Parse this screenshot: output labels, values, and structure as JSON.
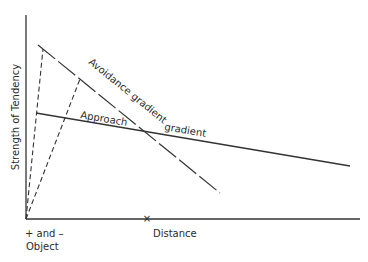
{
  "diagram": {
    "y_axis_label": "Strength of Tendency",
    "x_axis_label": "Distance",
    "origin_label_line1": "+ and –",
    "origin_label_line2": "Object",
    "x_marker": "×",
    "lines": [
      {
        "name": "avoidance-gradient",
        "label": "Avoidance gradient",
        "style": "long-dash"
      },
      {
        "name": "approach-gradient",
        "label_part1": "Approach",
        "label_part2": "gradient",
        "style": "solid"
      }
    ],
    "construction_lines": 2,
    "colors": {
      "ink": "#2a2a2a",
      "background": "#ffffff"
    }
  }
}
